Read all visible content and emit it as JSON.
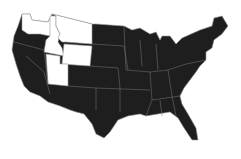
{
  "map": {
    "type": "choropleth",
    "region": "United States",
    "colors": {
      "highlighted": "#ffffff",
      "default": "#1e1e1e",
      "border": "#9a9a9a",
      "background": "#ffffff"
    },
    "highlighted_states": [
      "Washington",
      "Idaho",
      "Montana",
      "Wyoming",
      "Utah"
    ],
    "other_states": "all remaining contiguous states shown dark"
  }
}
